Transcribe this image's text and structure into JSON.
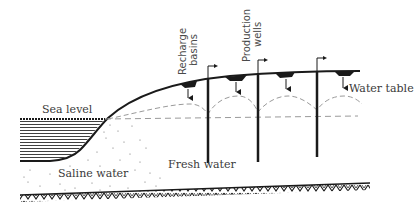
{
  "diagram": {
    "title": "",
    "labels": {
      "sea_level": "Sea level",
      "saline_water": "Saline water",
      "fresh_water": "Fresh water",
      "water_table": "Water table",
      "recharge_basins_line1": "Recharge",
      "recharge_basins_line2": "basins",
      "production_wells_line1": "Production",
      "production_wells_line2": "wells"
    },
    "elements": {
      "sea": "hatched body of sea water on the left",
      "land_surface": "curved ground surface rising from shoreline to the right",
      "recharge_basins": 4,
      "production_wells": 3,
      "bedrock": "hatched impermeable base layer"
    },
    "colors": {
      "ink": "#1a1a1a",
      "dashed": "#9a9a9a",
      "text": "#3a3a3a"
    }
  }
}
